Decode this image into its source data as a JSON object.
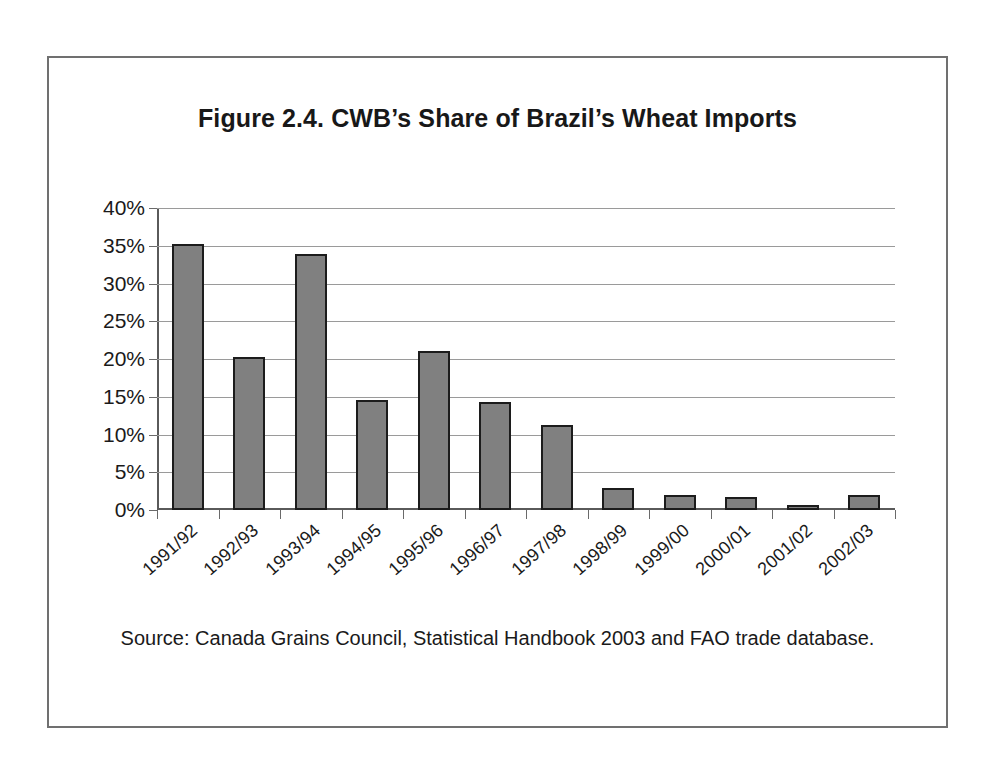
{
  "figure": {
    "title": "Figure 2.4. CWB’s Share of Brazil’s Wheat Imports",
    "source_note": "Source: Canada Grains Council, Statistical Handbook 2003 and FAO trade database.",
    "border_color": "#707070"
  },
  "chart_data": {
    "type": "bar",
    "title": "Figure 2.4. CWB’s Share of Brazil’s Wheat Imports",
    "xlabel": "",
    "ylabel": "",
    "categories": [
      "1991/92",
      "1992/93",
      "1993/94",
      "1994/95",
      "1995/96",
      "1996/97",
      "1997/98",
      "1998/99",
      "1999/00",
      "2000/01",
      "2001/02",
      "2002/03"
    ],
    "values": [
      35.2,
      20.3,
      33.9,
      14.6,
      21.0,
      14.3,
      11.2,
      2.9,
      2.0,
      1.7,
      0.6,
      2.0
    ],
    "value_unit": "%",
    "ylim": [
      0,
      40
    ],
    "yticks": [
      0,
      5,
      10,
      15,
      20,
      25,
      30,
      35,
      40
    ],
    "ytick_labels": [
      "0%",
      "5%",
      "10%",
      "15%",
      "20%",
      "25%",
      "30%",
      "35%",
      "40%"
    ],
    "grid": "horizontal",
    "legend": "none",
    "bar_fill_color": "#808080",
    "bar_border_color": "#1c1c1c",
    "gridline_color": "#9a9a9a"
  }
}
